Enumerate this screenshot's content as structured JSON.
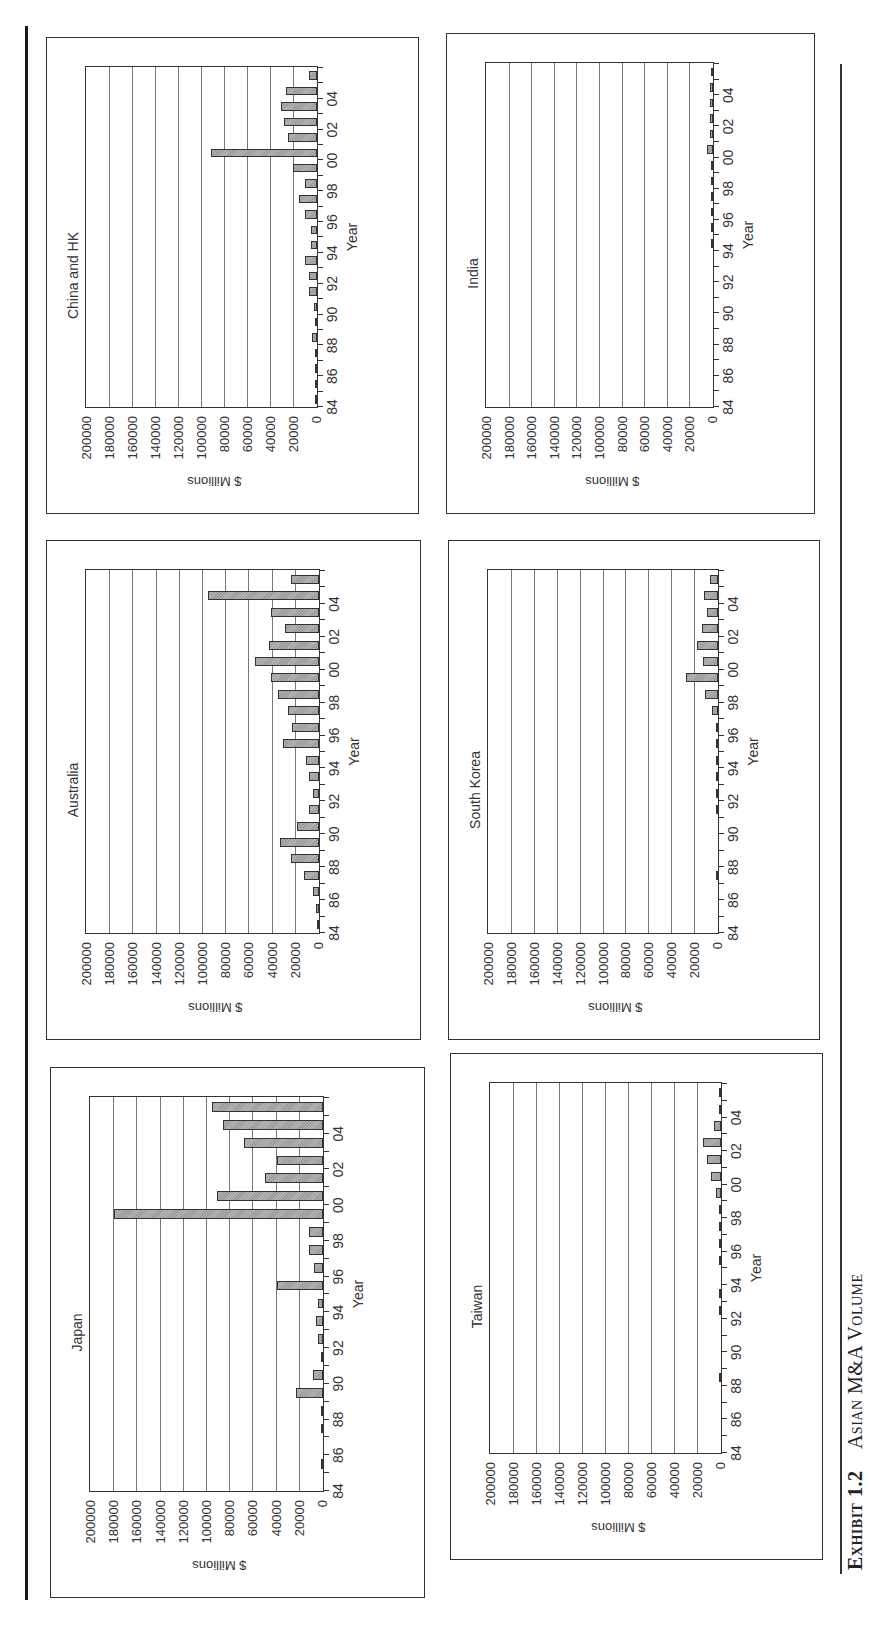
{
  "caption": {
    "exhibit": "Exhibit 1.2",
    "title": "Asian M&A Volume"
  },
  "axis": {
    "ylabel": "$ Millions",
    "xlabel": "Year",
    "yticks": [
      "200000",
      "180000",
      "160000",
      "140000",
      "120000",
      "100000",
      "80000",
      "60000",
      "40000",
      "20000",
      "0"
    ],
    "xticks": [
      "84",
      "86",
      "88",
      "90",
      "92",
      "94",
      "96",
      "98",
      "00",
      "02",
      "04"
    ],
    "ymax": 200000
  },
  "colors": {
    "bar_fill": "#a8a8a8",
    "bar_border": "#333333",
    "grid": "#777777",
    "frame": "#333333"
  },
  "chart_data": [
    {
      "type": "bar",
      "title": "Japan",
      "xlabel": "Year",
      "ylabel": "$ Millions",
      "ylim": [
        0,
        200000
      ],
      "grid": true,
      "categories": [
        "84",
        "85",
        "86",
        "87",
        "88",
        "89",
        "90",
        "91",
        "92",
        "93",
        "94",
        "95",
        "96",
        "97",
        "98",
        "99",
        "00",
        "01",
        "02",
        "03",
        "04",
        "05"
      ],
      "values": [
        0,
        1000,
        0,
        1000,
        2000,
        23000,
        9000,
        2000,
        4000,
        6000,
        4000,
        40000,
        8000,
        12000,
        12000,
        180000,
        91000,
        50000,
        40000,
        68000,
        86000,
        96000
      ]
    },
    {
      "type": "bar",
      "title": "Australia",
      "xlabel": "Year",
      "ylabel": "$ Millions",
      "ylim": [
        0,
        200000
      ],
      "grid": true,
      "categories": [
        "84",
        "85",
        "86",
        "87",
        "88",
        "89",
        "90",
        "91",
        "92",
        "93",
        "94",
        "95",
        "96",
        "97",
        "98",
        "99",
        "00",
        "01",
        "02",
        "03",
        "04",
        "05"
      ],
      "values": [
        500,
        3000,
        5000,
        13000,
        24000,
        34000,
        19000,
        9000,
        5000,
        9000,
        11000,
        31000,
        23000,
        27000,
        35000,
        41000,
        55000,
        43000,
        29000,
        41000,
        96000,
        24000
      ]
    },
    {
      "type": "bar",
      "title": "China and HK",
      "xlabel": "Year",
      "ylabel": "$ Millions",
      "ylim": [
        0,
        200000
      ],
      "grid": true,
      "categories": [
        "84",
        "85",
        "86",
        "87",
        "88",
        "89",
        "90",
        "91",
        "92",
        "93",
        "94",
        "95",
        "96",
        "97",
        "98",
        "99",
        "00",
        "01",
        "02",
        "03",
        "04",
        "05"
      ],
      "values": [
        500,
        500,
        500,
        500,
        4000,
        1500,
        3000,
        7000,
        7000,
        10000,
        5000,
        5000,
        10000,
        16000,
        10000,
        21000,
        92000,
        25000,
        29000,
        31000,
        27000,
        7000
      ]
    },
    {
      "type": "bar",
      "title": "Taiwan",
      "xlabel": "Year",
      "ylabel": "$ Millions",
      "ylim": [
        0,
        200000
      ],
      "grid": true,
      "categories": [
        "84",
        "85",
        "86",
        "87",
        "88",
        "89",
        "90",
        "91",
        "92",
        "93",
        "94",
        "95",
        "96",
        "97",
        "98",
        "99",
        "00",
        "01",
        "02",
        "03",
        "04",
        "05"
      ],
      "values": [
        0,
        0,
        0,
        0,
        500,
        0,
        300,
        0,
        500,
        500,
        300,
        500,
        500,
        1000,
        1500,
        4000,
        9000,
        12000,
        16000,
        6000,
        2000,
        1000
      ]
    },
    {
      "type": "bar",
      "title": "South Korea",
      "xlabel": "Year",
      "ylabel": "$ Millions",
      "ylim": [
        0,
        200000
      ],
      "grid": true,
      "categories": [
        "84",
        "85",
        "86",
        "87",
        "88",
        "89",
        "90",
        "91",
        "92",
        "93",
        "94",
        "95",
        "96",
        "97",
        "98",
        "99",
        "00",
        "01",
        "02",
        "03",
        "04",
        "05"
      ],
      "values": [
        0,
        0,
        0,
        500,
        0,
        0,
        300,
        500,
        500,
        500,
        500,
        1500,
        500,
        5000,
        11000,
        28000,
        13000,
        18000,
        14000,
        10000,
        12000,
        7000
      ]
    },
    {
      "type": "bar",
      "title": "India",
      "xlabel": "Year",
      "ylabel": "$ Millions",
      "ylim": [
        0,
        200000
      ],
      "grid": true,
      "categories": [
        "84",
        "85",
        "86",
        "87",
        "88",
        "89",
        "90",
        "91",
        "92",
        "93",
        "94",
        "95",
        "96",
        "97",
        "98",
        "99",
        "00",
        "01",
        "02",
        "03",
        "04",
        "05"
      ],
      "values": [
        0,
        0,
        0,
        0,
        0,
        0,
        0,
        0,
        0,
        300,
        1000,
        1500,
        1500,
        1500,
        1500,
        1500,
        5000,
        3000,
        3000,
        3000,
        3000,
        1000
      ]
    }
  ]
}
